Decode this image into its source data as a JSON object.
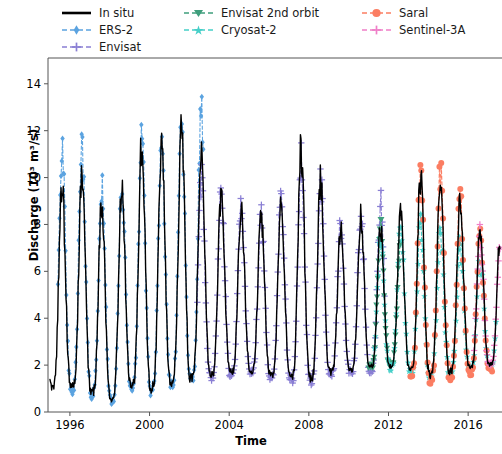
{
  "chart_data": {
    "type": "line",
    "title": "",
    "xlabel": "Time",
    "ylabel": "Discharge (10³ m³/s)",
    "xlim": [
      1994.9,
      2017.7
    ],
    "ylim": [
      0,
      15.1
    ],
    "yticks": [
      0,
      2,
      4,
      6,
      8,
      10,
      12,
      14
    ],
    "ytick_labels": [
      "0",
      "2",
      "4",
      "6",
      "8",
      "10",
      "12",
      "14"
    ],
    "xticks": [
      1996,
      2000,
      2004,
      2008,
      2012,
      2016
    ],
    "xtick_labels": [
      "1996",
      "2000",
      "2004",
      "2008",
      "2012",
      "2016"
    ],
    "grid": false,
    "legend_position": "above-axes",
    "units": "10^3 m^3/s",
    "series": [
      {
        "name": "In situ",
        "color": "#000000",
        "linestyle": "solid",
        "marker": "none",
        "linewidth": 1.4,
        "x_start": 1995.0,
        "x_end": 2017.6,
        "samples_per_year": 36,
        "seasonal": {
          "peak_month_frac": 0.6,
          "baseline": 1.9,
          "amplitude": 4.3,
          "peak_sharpness": 3.4
        },
        "peak_years": [
          1996,
          1997,
          1998,
          1999,
          2000,
          2001,
          2002,
          2003,
          2004,
          2005,
          2006,
          2007,
          2008,
          2009,
          2010,
          2011,
          2012,
          2013,
          2014,
          2015,
          2016,
          2017
        ],
        "peak_values": [
          9.6,
          10.4,
          7.9,
          10.6,
          12.1,
          11.2,
          13.0,
          9.8,
          9.0,
          8.6,
          8.2,
          9.5,
          12.3,
          8.4,
          7.6,
          8.8,
          7.2,
          9.1,
          10.6,
          9.9,
          8.3,
          7.4
        ],
        "min_values": [
          1.1,
          0.9,
          0.5,
          1.2,
          1.0,
          1.3,
          1.4,
          1.6,
          1.7,
          1.8,
          1.6,
          1.5,
          1.4,
          1.7,
          1.8,
          1.9,
          2.0,
          1.8,
          1.6,
          1.7,
          1.9,
          2.0
        ]
      },
      {
        "name": "ERS-2",
        "color": "#5ba3e0",
        "linestyle": "dashed",
        "marker": "diamond",
        "linewidth": 1.1,
        "x_start": 1995.4,
        "x_end": 2002.7,
        "samples_per_year": 26,
        "seasonal": {
          "peak_month_frac": 0.6,
          "baseline": 1.8,
          "amplitude": 4.4,
          "peak_sharpness": 3.2
        },
        "peak_years": [
          1996,
          1997,
          1998,
          1999,
          2000,
          2001,
          2002
        ],
        "peak_values": [
          11.4,
          11.3,
          8.6,
          10.3,
          12.2,
          10.8,
          13.0
        ],
        "min_values": [
          1.0,
          0.8,
          0.4,
          1.1,
          0.9,
          1.2,
          1.3
        ]
      },
      {
        "name": "Envisat",
        "color": "#8a7fd4",
        "linestyle": "dashed",
        "marker": "plus",
        "linewidth": 1.1,
        "x_start": 2002.4,
        "x_end": 2011.8,
        "samples_per_year": 28,
        "seasonal": {
          "peak_month_frac": 0.6,
          "baseline": 1.9,
          "amplitude": 4.0,
          "peak_sharpness": 3.3
        },
        "peak_years": [
          2003,
          2004,
          2005,
          2006,
          2007,
          2008,
          2009,
          2010,
          2011
        ],
        "peak_values": [
          9.9,
          9.1,
          8.7,
          8.3,
          9.6,
          11.7,
          8.5,
          7.7,
          8.9
        ],
        "min_values": [
          1.5,
          1.6,
          1.7,
          1.5,
          1.4,
          1.3,
          1.6,
          1.7,
          1.8
        ]
      },
      {
        "name": "Envisat 2nd orbit",
        "color": "#3f9e7c",
        "linestyle": "dashed",
        "marker": "triangle-down",
        "linewidth": 1.1,
        "x_start": 2011.0,
        "x_end": 2012.6,
        "samples_per_year": 28,
        "seasonal": {
          "peak_month_frac": 0.6,
          "baseline": 2.0,
          "amplitude": 3.6,
          "peak_sharpness": 3.3
        },
        "peak_years": [
          2011,
          2012
        ],
        "peak_values": [
          8.9,
          7.3
        ],
        "min_values": [
          1.9,
          2.0
        ]
      },
      {
        "name": "Cryosat-2",
        "color": "#46cfc8",
        "linestyle": "dashed",
        "marker": "star",
        "linewidth": 1.1,
        "x_start": 2011.3,
        "x_end": 2017.4,
        "samples_per_year": 22,
        "seasonal": {
          "peak_month_frac": 0.6,
          "baseline": 2.0,
          "amplitude": 3.6,
          "peak_sharpness": 3.1
        },
        "peak_years": [
          2012,
          2013,
          2014,
          2015,
          2016,
          2017
        ],
        "peak_values": [
          7.4,
          8.4,
          7.9,
          7.6,
          7.0,
          6.4
        ],
        "min_values": [
          1.9,
          1.7,
          1.5,
          1.6,
          1.8,
          1.9
        ]
      },
      {
        "name": "Saral",
        "color": "#fb7d62",
        "linestyle": "dashed",
        "marker": "circle",
        "linewidth": 1.1,
        "x_start": 2013.1,
        "x_end": 2017.2,
        "samples_per_year": 22,
        "seasonal": {
          "peak_month_frac": 0.6,
          "baseline": 1.8,
          "amplitude": 4.0,
          "peak_sharpness": 3.2
        },
        "peak_years": [
          2013,
          2014,
          2015,
          2016,
          2017
        ],
        "peak_values": [
          8.6,
          10.6,
          10.0,
          8.4,
          7.2
        ],
        "min_values": [
          1.6,
          1.4,
          1.5,
          1.7,
          1.8
        ]
      },
      {
        "name": "Sentinel-3A",
        "color": "#ef7fc8",
        "linestyle": "dashed",
        "marker": "plus",
        "linewidth": 1.1,
        "x_start": 2016.3,
        "x_end": 2017.6,
        "samples_per_year": 28,
        "seasonal": {
          "peak_month_frac": 0.6,
          "baseline": 1.9,
          "amplitude": 3.8,
          "peak_sharpness": 3.2
        },
        "peak_years": [
          2016,
          2017
        ],
        "peak_values": [
          8.2,
          7.1
        ],
        "min_values": [
          1.9,
          2.0
        ]
      }
    ]
  },
  "legend": {
    "rows": [
      [
        {
          "label": "In situ",
          "key": "line-solid-black"
        },
        {
          "label": "Envisat 2nd orbit",
          "key": "line-dashed-triangle-green"
        },
        {
          "label": "Saral",
          "key": "line-dashed-circle-salmon"
        }
      ],
      [
        {
          "label": "ERS-2",
          "key": "line-dashed-diamond-blue"
        },
        {
          "label": "Cryosat-2",
          "key": "line-dashed-star-turquoise"
        },
        {
          "label": "Sentinel-3A",
          "key": "line-dashed-plus-pink"
        }
      ],
      [
        {
          "label": "Envisat",
          "key": "line-dashed-plus-purple"
        }
      ]
    ]
  },
  "axes": {
    "x_label": "Time",
    "y_label": "Discharge (10³ m³/s)"
  },
  "colors": {
    "in_situ": "#000000",
    "ers2": "#5ba3e0",
    "envisat": "#8a7fd4",
    "envisat_2nd": "#3f9e7c",
    "cryosat2": "#46cfc8",
    "saral": "#fb7d62",
    "sentinel3a": "#ef7fc8",
    "axis": "#333333",
    "background": "#ffffff"
  }
}
